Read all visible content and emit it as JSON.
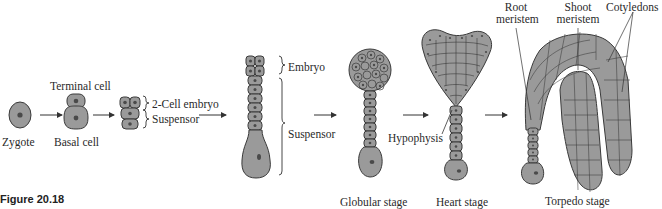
{
  "figure": {
    "number": "Figure 20.18",
    "caption_partial": "(caption text cut off at bottom edge)"
  },
  "colors": {
    "cell_fill": "#9a9a9a",
    "cell_stroke": "#3a3a3a",
    "nucleus_fill": "#5a5a5a",
    "line": "#333333",
    "background": "#ffffff"
  },
  "labels": {
    "zygote": "Zygote",
    "terminal_cell": "Terminal cell",
    "basal_cell": "Basal cell",
    "two_cell_embryo": "2-Cell embryo",
    "suspensor_early": "Suspensor",
    "embryo": "Embryo",
    "suspensor_late": "Suspensor",
    "hypophysis": "Hypophysis",
    "root_meristem": [
      "Root",
      "meristem"
    ],
    "shoot_meristem": [
      "Shoot",
      "meristem"
    ],
    "cotyledons": "Cotyledons"
  },
  "stages": [
    {
      "id": "zygote",
      "label": "Zygote"
    },
    {
      "id": "two-cell",
      "label": "Basal cell"
    },
    {
      "id": "quadrant",
      "label": ""
    },
    {
      "id": "octant",
      "label": ""
    },
    {
      "id": "globular",
      "label": "Globular stage"
    },
    {
      "id": "heart",
      "label": "Heart stage"
    },
    {
      "id": "torpedo",
      "label": "Torpedo stage"
    }
  ]
}
